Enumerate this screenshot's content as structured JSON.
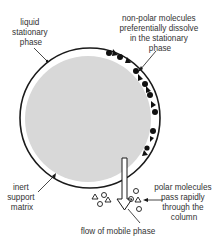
{
  "labels": {
    "stationary_phase": [
      "liquid",
      "stationary",
      "phase"
    ],
    "non_polar": [
      "non-polar molecules",
      "preferentially dissolve",
      "in the stationary",
      "phase"
    ],
    "support_matrix": [
      "inert",
      "support",
      "matrix"
    ],
    "polar": [
      "polar molecules",
      "pass rapidly",
      "through the",
      "column"
    ],
    "mobile_phase": "flow of mobile phase"
  },
  "colors": {
    "matrix_fill": "#d8d8d8",
    "outline": "#1a1a1a",
    "text": "#333333"
  }
}
